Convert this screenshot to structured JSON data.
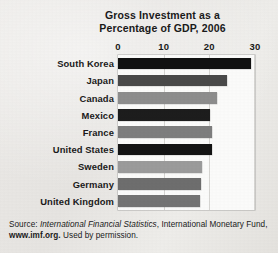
{
  "chart_data": {
    "type": "bar",
    "orientation": "horizontal",
    "title": "Gross Investment as a Percentage of GDP, 2006",
    "title_lines": [
      "Gross Investment as a",
      "Percentage of GDP, 2006"
    ],
    "xlabel": "",
    "ylabel": "",
    "xlim": [
      0,
      30
    ],
    "xticks": [
      0,
      10,
      20,
      30
    ],
    "xtick_labels": [
      "0",
      "10",
      "20",
      "30"
    ],
    "grid": true,
    "grid_axis": "x",
    "legend": false,
    "categories": [
      "South Korea",
      "Japan",
      "Canada",
      "Mexico",
      "France",
      "United States",
      "Sweden",
      "Germany",
      "United Kingdom"
    ],
    "values": [
      29.2,
      23.8,
      21.7,
      20.1,
      20.5,
      20.5,
      18.3,
      18.2,
      18.0
    ],
    "bar_colors": [
      "#111111",
      "#4a4a4a",
      "#8d8d8d",
      "#1d1d1d",
      "#7e7e7e",
      "#141414",
      "#9b9b9b",
      "#6e6e6e",
      "#747474"
    ]
  },
  "source": {
    "line1_prefix": "Source: ",
    "line1_italic": "International Financial Statistics",
    "line1_suffix": ", International Monetary Fund,",
    "line2_bold": "www.imf.org.",
    "line2_suffix": " Used by permission."
  },
  "colors": {
    "page_background": "#e9e8e6",
    "plot_background": "#fbfbfa",
    "gridline": "#d6d5d2",
    "text": "#1a1a1a"
  }
}
